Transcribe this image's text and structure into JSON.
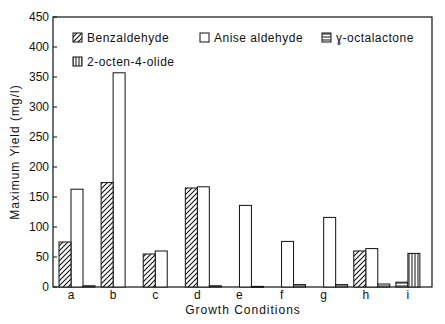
{
  "chart_data": {
    "type": "bar",
    "title": "",
    "xlabel": "Growth Conditions",
    "ylabel": "Maximum Yield (mg/l)",
    "ylim": [
      0,
      450
    ],
    "yticks": [
      0,
      50,
      100,
      150,
      200,
      250,
      300,
      350,
      400,
      450
    ],
    "grid": false,
    "legend_position": "upper-left inside",
    "categories": [
      "a",
      "b",
      "c",
      "d",
      "e",
      "f",
      "g",
      "h",
      "i"
    ],
    "series": [
      {
        "name": "Benzaldehyde",
        "pattern": "diagonal-hatch",
        "values": [
          75,
          174,
          55,
          165,
          0,
          0,
          0,
          60,
          0
        ]
      },
      {
        "name": "Anise aldehyde",
        "pattern": "open",
        "values": [
          163,
          357,
          60,
          167,
          136,
          76,
          116,
          64,
          0
        ]
      },
      {
        "name": "γ-octalactone",
        "pattern": "horizontal-hatch",
        "values": [
          2,
          0,
          0,
          2,
          1,
          4,
          4,
          5,
          8
        ]
      },
      {
        "name": "2-octen-4-olide",
        "pattern": "vertical-hatch",
        "values": [
          0,
          0,
          0,
          0,
          0,
          0,
          0,
          0,
          56
        ]
      }
    ]
  },
  "legend": {
    "items": [
      {
        "label": "Benzaldehyde",
        "icon": "diagonal-hatch-swatch"
      },
      {
        "label": "Anise aldehyde",
        "icon": "open-swatch"
      },
      {
        "label": "ɣ-octalactone",
        "icon": "horizontal-hatch-swatch"
      },
      {
        "label": "2-octen-4-olide",
        "icon": "vertical-hatch-swatch"
      }
    ]
  },
  "axes": {
    "x_title": "Growth Conditions",
    "y_title": "Maximum Yield (mg/l)"
  },
  "colors": {
    "ink": "#111111",
    "background": "#ffffff"
  }
}
